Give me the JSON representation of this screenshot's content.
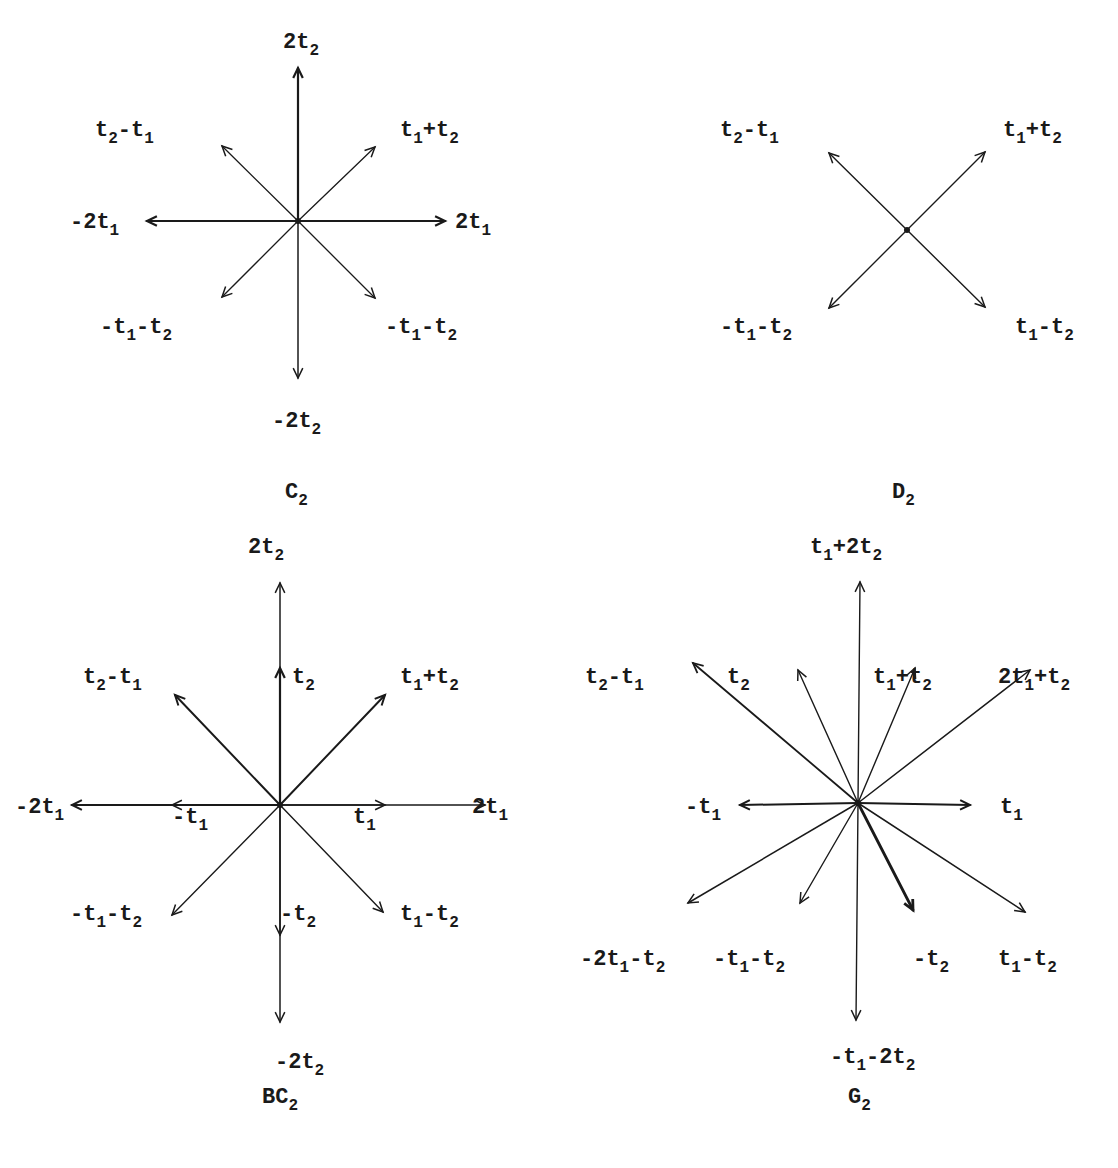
{
  "diagrams": [
    {
      "name": "C2",
      "caption": {
        "base": "C",
        "sub": "2",
        "x": 285,
        "y": 498
      },
      "center": [
        298,
        221
      ],
      "arrows": [
        {
          "to": [
            298,
            68
          ],
          "w": 2.2
        },
        {
          "to": [
            298,
            378
          ],
          "w": 1.5
        },
        {
          "to": [
            445,
            221
          ],
          "w": 2.2
        },
        {
          "to": [
            147,
            221
          ],
          "w": 2.2
        },
        {
          "to": [
            375,
            147
          ],
          "w": 1.3
        },
        {
          "to": [
            222,
            146
          ],
          "w": 1.3
        },
        {
          "to": [
            222,
            297
          ],
          "w": 1.3
        },
        {
          "to": [
            375,
            298
          ],
          "w": 1.3
        }
      ],
      "labels": [
        {
          "parts": [
            [
              "2t",
              ""
            ],
            [
              "",
              "2"
            ]
          ],
          "x": 283,
          "y": 48
        },
        {
          "parts": [
            [
              "t",
              ""
            ],
            [
              "",
              "2"
            ],
            [
              "-t",
              ""
            ],
            [
              "",
              "1"
            ]
          ],
          "x": 95,
          "y": 136
        },
        {
          "parts": [
            [
              "t",
              ""
            ],
            [
              "",
              "1"
            ],
            [
              "+t",
              ""
            ],
            [
              "",
              "2"
            ]
          ],
          "x": 400,
          "y": 136
        },
        {
          "parts": [
            [
              "-2t",
              ""
            ],
            [
              "",
              "1"
            ]
          ],
          "x": 70,
          "y": 228
        },
        {
          "parts": [
            [
              "2t",
              ""
            ],
            [
              "",
              "1"
            ]
          ],
          "x": 455,
          "y": 228
        },
        {
          "parts": [
            [
              "-t",
              ""
            ],
            [
              "",
              "1"
            ],
            [
              "-t",
              ""
            ],
            [
              "",
              "2"
            ]
          ],
          "x": 100,
          "y": 333
        },
        {
          "parts": [
            [
              "-t",
              ""
            ],
            [
              "",
              "1"
            ],
            [
              "-t",
              ""
            ],
            [
              "",
              "2"
            ]
          ],
          "x": 385,
          "y": 333
        },
        {
          "parts": [
            [
              "-2t",
              ""
            ],
            [
              "",
              "2"
            ]
          ],
          "x": 272,
          "y": 427
        }
      ]
    },
    {
      "name": "D2",
      "caption": {
        "base": "D",
        "sub": "2",
        "x": 892,
        "y": 498
      },
      "center": [
        907,
        230
      ],
      "arrows": [
        {
          "to": [
            985,
            152
          ],
          "w": 1.4
        },
        {
          "to": [
            829,
            153
          ],
          "w": 1.4
        },
        {
          "to": [
            829,
            308
          ],
          "w": 1.4
        },
        {
          "to": [
            985,
            307
          ],
          "w": 1.4
        }
      ],
      "labels": [
        {
          "parts": [
            [
              "t",
              ""
            ],
            [
              "",
              "2"
            ],
            [
              "-t",
              ""
            ],
            [
              "",
              "1"
            ]
          ],
          "x": 720,
          "y": 136
        },
        {
          "parts": [
            [
              "t",
              ""
            ],
            [
              "",
              "1"
            ],
            [
              "+t",
              ""
            ],
            [
              "",
              "2"
            ]
          ],
          "x": 1003,
          "y": 136
        },
        {
          "parts": [
            [
              "-t",
              ""
            ],
            [
              "",
              "1"
            ],
            [
              "-t",
              ""
            ],
            [
              "",
              "2"
            ]
          ],
          "x": 720,
          "y": 333
        },
        {
          "parts": [
            [
              "t",
              ""
            ],
            [
              "",
              "1"
            ],
            [
              "-t",
              ""
            ],
            [
              "",
              "2"
            ]
          ],
          "x": 1015,
          "y": 333
        }
      ]
    },
    {
      "name": "BC2",
      "caption": {
        "base": "BC",
        "sub": "2",
        "x": 262,
        "y": 1103
      },
      "center": [
        280,
        805
      ],
      "arrows": [
        {
          "to": [
            280,
            583
          ],
          "w": 1.5
        },
        {
          "to": [
            280,
            1022
          ],
          "w": 1.5
        },
        {
          "to": [
            72,
            805
          ],
          "w": 2
        },
        {
          "to": [
            485,
            805
          ],
          "w": 1.5
        },
        {
          "to": [
            280,
            668
          ],
          "w": 2.2
        },
        {
          "to": [
            280,
            935
          ],
          "w": 1.5
        },
        {
          "to": [
            172,
            805
          ],
          "w": 1.3
        },
        {
          "to": [
            385,
            805
          ],
          "w": 1.3
        },
        {
          "to": [
            385,
            695
          ],
          "w": 2
        },
        {
          "to": [
            175,
            695
          ],
          "w": 2
        },
        {
          "to": [
            172,
            915
          ],
          "w": 1.4
        },
        {
          "to": [
            383,
            912
          ],
          "w": 1.4
        }
      ],
      "labels": [
        {
          "parts": [
            [
              "2t",
              ""
            ],
            [
              "",
              "2"
            ]
          ],
          "x": 248,
          "y": 553
        },
        {
          "parts": [
            [
              "t",
              ""
            ],
            [
              "",
              "2"
            ]
          ],
          "x": 292,
          "y": 683
        },
        {
          "parts": [
            [
              "t",
              ""
            ],
            [
              "",
              "2"
            ],
            [
              "-t",
              ""
            ],
            [
              "",
              "1"
            ]
          ],
          "x": 83,
          "y": 683
        },
        {
          "parts": [
            [
              "t",
              ""
            ],
            [
              "",
              "1"
            ],
            [
              "+t",
              ""
            ],
            [
              "",
              "2"
            ]
          ],
          "x": 400,
          "y": 683
        },
        {
          "parts": [
            [
              "-2t",
              ""
            ],
            [
              "",
              "1"
            ]
          ],
          "x": 15,
          "y": 813
        },
        {
          "parts": [
            [
              "-t",
              ""
            ],
            [
              "",
              "1"
            ]
          ],
          "x": 172,
          "y": 823
        },
        {
          "parts": [
            [
              "t",
              ""
            ],
            [
              "",
              "1"
            ]
          ],
          "x": 353,
          "y": 823
        },
        {
          "parts": [
            [
              "2t",
              ""
            ],
            [
              "",
              "1"
            ]
          ],
          "x": 472,
          "y": 813
        },
        {
          "parts": [
            [
              "-t",
              ""
            ],
            [
              "",
              "1"
            ],
            [
              "-t",
              ""
            ],
            [
              "",
              "2"
            ]
          ],
          "x": 70,
          "y": 920
        },
        {
          "parts": [
            [
              "-t",
              ""
            ],
            [
              "",
              "2"
            ]
          ],
          "x": 280,
          "y": 920
        },
        {
          "parts": [
            [
              "t",
              ""
            ],
            [
              "",
              "1"
            ],
            [
              "-t",
              ""
            ],
            [
              "",
              "2"
            ]
          ],
          "x": 400,
          "y": 920
        },
        {
          "parts": [
            [
              "-2t",
              ""
            ],
            [
              "",
              "2"
            ]
          ],
          "x": 275,
          "y": 1068
        }
      ]
    },
    {
      "name": "G2",
      "caption": {
        "base": "G",
        "sub": "2",
        "x": 848,
        "y": 1103
      },
      "center": [
        858,
        803
      ],
      "arrows": [
        {
          "to": [
            860,
            582
          ],
          "w": 1.4
        },
        {
          "to": [
            856,
            1020
          ],
          "w": 1.4
        },
        {
          "to": [
            740,
            805
          ],
          "w": 2
        },
        {
          "to": [
            970,
            805
          ],
          "w": 2
        },
        {
          "to": [
            798,
            670
          ],
          "w": 1.4
        },
        {
          "to": [
            915,
            668
          ],
          "w": 1.4
        },
        {
          "to": [
            693,
            663
          ],
          "w": 1.8
        },
        {
          "to": [
            1030,
            670
          ],
          "w": 1.5
        },
        {
          "to": [
            688,
            903
          ],
          "w": 1.5
        },
        {
          "to": [
            800,
            903
          ],
          "w": 1.4
        },
        {
          "to": [
            913,
            910
          ],
          "w": 2.8
        },
        {
          "to": [
            1025,
            912
          ],
          "w": 1.5
        }
      ],
      "labels": [
        {
          "parts": [
            [
              "t",
              ""
            ],
            [
              "",
              "1"
            ],
            [
              "+2t",
              ""
            ],
            [
              "",
              "2"
            ]
          ],
          "x": 810,
          "y": 553
        },
        {
          "parts": [
            [
              "t",
              ""
            ],
            [
              "",
              "2"
            ],
            [
              "-t",
              ""
            ],
            [
              "",
              "1"
            ]
          ],
          "x": 585,
          "y": 683
        },
        {
          "parts": [
            [
              "t",
              ""
            ],
            [
              "",
              "2"
            ]
          ],
          "x": 727,
          "y": 683
        },
        {
          "parts": [
            [
              "t",
              ""
            ],
            [
              "",
              "1"
            ],
            [
              "+t",
              ""
            ],
            [
              "",
              "2"
            ]
          ],
          "x": 873,
          "y": 683
        },
        {
          "parts": [
            [
              "2t",
              ""
            ],
            [
              "",
              "1"
            ],
            [
              "+t",
              ""
            ],
            [
              "",
              "2"
            ]
          ],
          "x": 998,
          "y": 683
        },
        {
          "parts": [
            [
              "-t",
              ""
            ],
            [
              "",
              "1"
            ]
          ],
          "x": 685,
          "y": 813
        },
        {
          "parts": [
            [
              "t",
              ""
            ],
            [
              "",
              "1"
            ]
          ],
          "x": 1000,
          "y": 813
        },
        {
          "parts": [
            [
              "-2t",
              ""
            ],
            [
              "",
              "1"
            ],
            [
              "-t",
              ""
            ],
            [
              "",
              "2"
            ]
          ],
          "x": 580,
          "y": 965
        },
        {
          "parts": [
            [
              "-t",
              ""
            ],
            [
              "",
              "1"
            ],
            [
              "-t",
              ""
            ],
            [
              "",
              "2"
            ]
          ],
          "x": 713,
          "y": 965
        },
        {
          "parts": [
            [
              "-t",
              ""
            ],
            [
              "",
              "2"
            ]
          ],
          "x": 913,
          "y": 965
        },
        {
          "parts": [
            [
              "t",
              ""
            ],
            [
              "",
              "1"
            ],
            [
              "-t",
              ""
            ],
            [
              "",
              "2"
            ]
          ],
          "x": 998,
          "y": 965
        },
        {
          "parts": [
            [
              "-t",
              ""
            ],
            [
              "",
              "1"
            ],
            [
              "-2t",
              ""
            ],
            [
              "",
              "2"
            ]
          ],
          "x": 830,
          "y": 1063
        }
      ]
    }
  ]
}
